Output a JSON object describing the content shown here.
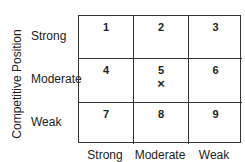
{
  "diagram": {
    "y_axis_title": "Competitive Position",
    "row_labels": [
      "Strong",
      "Moderate",
      "Weak"
    ],
    "col_labels": [
      "Strong",
      "Moderate",
      "Weak"
    ],
    "cells": [
      {
        "number": "1",
        "mark": ""
      },
      {
        "number": "2",
        "mark": ""
      },
      {
        "number": "3",
        "mark": ""
      },
      {
        "number": "4",
        "mark": ""
      },
      {
        "number": "5",
        "mark": "×"
      },
      {
        "number": "6",
        "mark": ""
      },
      {
        "number": "7",
        "mark": ""
      },
      {
        "number": "8",
        "mark": ""
      },
      {
        "number": "9",
        "mark": ""
      }
    ]
  }
}
